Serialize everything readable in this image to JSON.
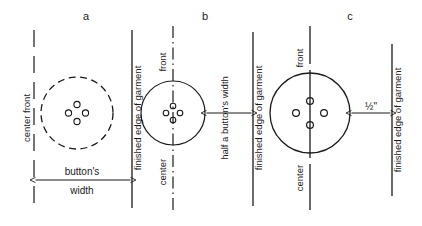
{
  "figure": {
    "ink_color": "#1a1a1a",
    "background_color": "#ffffff"
  },
  "panels": [
    {
      "id": "a",
      "letter": "a",
      "center_line_label": "center front",
      "center_line_style": "dashed",
      "button_outline_style": "dashed",
      "button_holes": 4,
      "edge_line_label": "finished edge of garment",
      "edge_line_style": "solid",
      "dimension": {
        "label_line_1": "button's",
        "label_line_2": "width",
        "full_label": "button's width",
        "from": "center front",
        "to": "finished edge of garment"
      }
    },
    {
      "id": "b",
      "letter": "b",
      "center_line_label_top": "front",
      "center_line_label_bottom": "center",
      "center_line_label_full": "center front",
      "center_line_style": "dash-dot",
      "button_outline_style": "solid",
      "button_holes": 4,
      "edge_line_label": "finished edge of garment",
      "edge_line_style": "solid",
      "dimension": {
        "label": "half a button's width",
        "from": "button edge",
        "to": "finished edge of garment"
      }
    },
    {
      "id": "c",
      "letter": "c",
      "center_line_label_top": "front",
      "center_line_label_bottom": "center",
      "center_line_label_full": "center front",
      "center_line_style": "solid-gapped",
      "button_outline_style": "solid",
      "button_holes": 4,
      "edge_line_label": "finished edge of garment",
      "edge_line_style": "solid",
      "dimension": {
        "label": "½\"",
        "from": "button edge",
        "to": "finished edge of garment"
      }
    }
  ]
}
